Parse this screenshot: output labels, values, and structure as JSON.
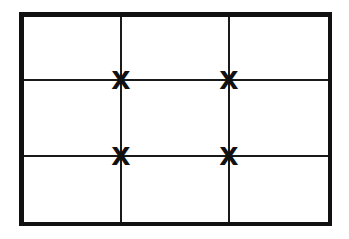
{
  "figure": {
    "kind": "composition-grid",
    "background_color": "#ffffff",
    "line_color": "#111111",
    "marker_color": "#111111"
  },
  "frame": {
    "name": "outer-frame",
    "x": 19,
    "y": 12,
    "width": 313,
    "height": 214,
    "border_width": 4.5
  },
  "grid": {
    "columns": 3,
    "rows": 3,
    "inner_line_width": 2,
    "vertical_lines": [
      121,
      229
    ],
    "horizontal_lines": [
      80,
      156
    ]
  },
  "markers": {
    "glyph": "X",
    "count": 4,
    "size": 25,
    "points": [
      {
        "id": "top-left-third",
        "x": 121,
        "y": 80,
        "label": "X"
      },
      {
        "id": "top-right-third",
        "x": 229,
        "y": 80,
        "label": "X"
      },
      {
        "id": "bottom-left-third",
        "x": 121,
        "y": 156,
        "label": "X"
      },
      {
        "id": "bottom-right-third",
        "x": 229,
        "y": 156,
        "label": "X"
      }
    ]
  },
  "cells": [
    {
      "id": "cell-r1c1",
      "row": 1,
      "col": 1
    },
    {
      "id": "cell-r1c2",
      "row": 1,
      "col": 2
    },
    {
      "id": "cell-r1c3",
      "row": 1,
      "col": 3
    },
    {
      "id": "cell-r2c1",
      "row": 2,
      "col": 1
    },
    {
      "id": "cell-r2c2",
      "row": 2,
      "col": 2
    },
    {
      "id": "cell-r2c3",
      "row": 2,
      "col": 3
    },
    {
      "id": "cell-r3c1",
      "row": 3,
      "col": 1
    },
    {
      "id": "cell-r3c2",
      "row": 3,
      "col": 2
    },
    {
      "id": "cell-r3c3",
      "row": 3,
      "col": 3
    }
  ]
}
